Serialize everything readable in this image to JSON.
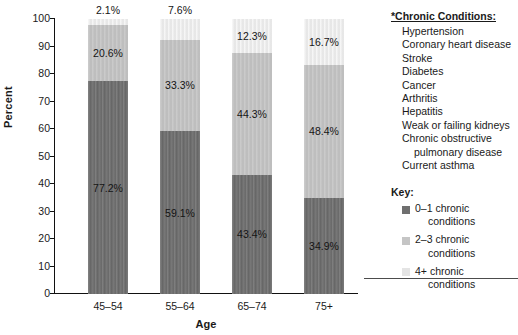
{
  "chart_data": {
    "type": "bar",
    "subtype": "stacked-bar-100-percent",
    "title": "",
    "xlabel": "Age",
    "ylabel": "Percent",
    "ylim": [
      0,
      100
    ],
    "ytick_step": 10,
    "yticks": [
      100,
      90,
      80,
      70,
      60,
      50,
      40,
      30,
      20,
      10,
      0
    ],
    "grid": false,
    "legend_position": "right",
    "categories": [
      "45–54",
      "55–64",
      "65–74",
      "75+"
    ],
    "series": [
      {
        "name": "0–1 chronic conditions",
        "color": "#6f6f6f",
        "values": [
          77.2,
          59.1,
          43.4,
          34.9
        ],
        "labels": [
          "77.2%",
          "59.1%",
          "43.4%",
          "34.9%"
        ]
      },
      {
        "name": "2–3 chronic conditions",
        "color": "#c5c5c5",
        "values": [
          20.6,
          33.3,
          44.3,
          48.4
        ],
        "labels": [
          "20.6%",
          "33.3%",
          "44.3%",
          "48.4%"
        ]
      },
      {
        "name": "4+ chronic conditions",
        "color": "#ececec",
        "values": [
          2.1,
          7.6,
          12.3,
          16.7
        ],
        "labels": [
          "2.1%",
          "7.6%",
          "12.3%",
          "16.7%"
        ]
      }
    ],
    "label_placement": {
      "0–1 chronic conditions": [
        "inside",
        "inside",
        "inside",
        "inside"
      ],
      "2–3 chronic conditions": [
        "inside",
        "inside",
        "inside",
        "inside"
      ],
      "4+ chronic conditions": [
        "above",
        "above",
        "inside",
        "inside"
      ]
    }
  },
  "axes": {
    "y_title": "Percent",
    "x_title": "Age",
    "y_tick_labels": [
      "100",
      "90",
      "80",
      "70",
      "60",
      "50",
      "40",
      "30",
      "20",
      "10",
      "0"
    ],
    "x_tick_labels": [
      "45–54",
      "55–64",
      "65–74",
      "75+"
    ]
  },
  "side_panel": {
    "conditions_heading": "*Chronic Conditions:",
    "conditions": [
      {
        "text": "Hypertension"
      },
      {
        "text": "Coronary heart disease"
      },
      {
        "text": "Stroke"
      },
      {
        "text": "Diabetes"
      },
      {
        "text": "Cancer"
      },
      {
        "text": "Arthritis"
      },
      {
        "text": "Hepatitis"
      },
      {
        "text": "Weak or failing kidneys"
      },
      {
        "text": "Chronic obstructive",
        "continuation": "pulmonary disease"
      },
      {
        "text": "Current asthma"
      }
    ],
    "key_heading": "Key:",
    "key_items": [
      {
        "line1": "0–1 chronic",
        "line2": "conditions",
        "color": "#6f6f6f"
      },
      {
        "line1": "2–3 chronic",
        "line2": "conditions",
        "color": "#c5c5c5"
      },
      {
        "line1": "4+ chronic",
        "line2": "conditions",
        "color": "#e4e4e4"
      }
    ]
  },
  "colors": {
    "axis": "#111111",
    "text": "#1a1a1a",
    "rule": "#4c4c4c",
    "background": "#ffffff"
  }
}
